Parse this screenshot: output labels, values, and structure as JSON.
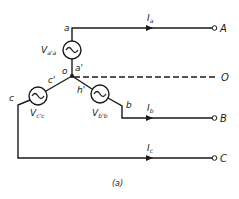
{
  "diagram": {
    "type": "three-phase Y-connected source",
    "caption": "(a)",
    "nodes": {
      "a": "a",
      "a_prime": "a'",
      "b": "b",
      "b_prime": "h'",
      "c": "c",
      "c_prime": "c'",
      "neutral": "o"
    },
    "sources": [
      {
        "id": "Va",
        "main": "V",
        "sub": "a'a"
      },
      {
        "id": "Vb",
        "main": "V",
        "sub": "b'b"
      },
      {
        "id": "Vc",
        "main": "V",
        "sub": "c'c"
      }
    ],
    "currents": [
      {
        "id": "Ia",
        "main": "I",
        "sub": "a"
      },
      {
        "id": "Ib",
        "main": "I",
        "sub": "b"
      },
      {
        "id": "Ic",
        "main": "I",
        "sub": "c"
      }
    ],
    "terminals": {
      "A": "A",
      "B": "B",
      "C": "C",
      "O": "O"
    },
    "colors": {
      "line": "#1a1a1a",
      "background": "#ffffff"
    }
  }
}
